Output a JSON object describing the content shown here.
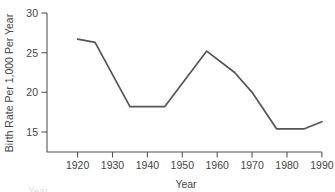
{
  "chart_data": {
    "type": "line",
    "title": "",
    "xlabel": "Year",
    "ylabel": "Birth Rate Per 1,000 Per Year",
    "xlim": [
      1913,
      1992
    ],
    "ylim": [
      12.5,
      30
    ],
    "xticks": [
      1920,
      1930,
      1940,
      1950,
      1960,
      1970,
      1980,
      1990
    ],
    "xticklabels": [
      "1920",
      "1930",
      "1940",
      "1950",
      "1960",
      "1970",
      "1980",
      "1990"
    ],
    "yticks": [
      15,
      20,
      25,
      30
    ],
    "yticklabels": [
      "15",
      "20",
      "25",
      "30"
    ],
    "grid": false,
    "legend": "none",
    "series": [
      {
        "name": "Birth Rate",
        "color": "#555555",
        "x": [
          1920,
          1925,
          1935,
          1945,
          1957,
          1965,
          1970,
          1977,
          1985,
          1990
        ],
        "values": [
          26.7,
          26.3,
          18.2,
          18.2,
          25.2,
          22.5,
          20.0,
          15.4,
          15.4,
          16.3
        ]
      }
    ]
  },
  "axes": {
    "y_axis_title": "Birth Rate Per 1,000 Per Year",
    "x_axis_title": "Year"
  },
  "ticks": {
    "y": [
      "30",
      "25",
      "20",
      "15"
    ],
    "x": [
      "1920",
      "1930",
      "1940",
      "1950",
      "1960",
      "1970",
      "1980",
      "1990"
    ]
  },
  "colors": {
    "line": "#555555",
    "axis": "#555555",
    "text": "#444444",
    "background": "#ffffff"
  },
  "footer": {
    "clipped_caption": "Year"
  }
}
